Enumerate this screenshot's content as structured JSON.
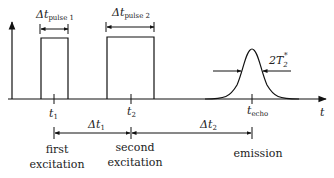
{
  "diagram": {
    "axis": {
      "x_label": "t"
    },
    "pulses": [
      {
        "id": "pulse1",
        "width_label_main": "Δt",
        "width_label_sub": "pulse 1",
        "time_label_main": "t",
        "time_label_sub": "1",
        "event_label_line1": "first",
        "event_label_line2": "excitation"
      },
      {
        "id": "pulse2",
        "width_label_main": "Δt",
        "width_label_sub": "pulse 2",
        "time_label_main": "t",
        "time_label_sub": "2",
        "event_label_line1": "second",
        "event_label_line2": "excitation"
      }
    ],
    "echo": {
      "time_label_main": "t",
      "time_label_sub": "echo",
      "width_label_main": "2T",
      "width_label_sub": "2",
      "width_label_sup": "*",
      "event_label": "emission"
    },
    "intervals": [
      {
        "label_main": "Δt",
        "label_sub": "1"
      },
      {
        "label_main": "Δt",
        "label_sub": "2"
      }
    ]
  }
}
